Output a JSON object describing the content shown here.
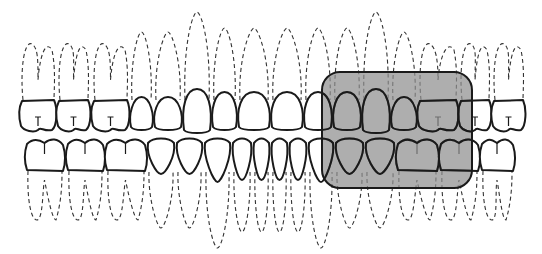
{
  "diagram": {
    "title": "",
    "colors": {
      "background": "#ffffff",
      "outline": "#1a1a1a",
      "root_dash": "#333333",
      "highlight_fill": "#8f8f8f"
    },
    "upper_arch": {
      "label": "",
      "teeth": [
        {
          "type": "molar",
          "x": 20,
          "w": 36
        },
        {
          "type": "molar",
          "x": 57,
          "w": 33
        },
        {
          "type": "molar",
          "x": 92,
          "w": 37
        },
        {
          "type": "premolar",
          "x": 130,
          "w": 23
        },
        {
          "type": "premolar",
          "x": 154,
          "w": 28
        },
        {
          "type": "canine",
          "x": 183,
          "w": 28
        },
        {
          "type": "incisor",
          "x": 212,
          "w": 25
        },
        {
          "type": "incisor",
          "x": 238,
          "w": 32
        },
        {
          "type": "incisor",
          "x": 271,
          "w": 32
        },
        {
          "type": "incisor",
          "x": 304,
          "w": 28
        },
        {
          "type": "incisor",
          "x": 333,
          "w": 28
        },
        {
          "type": "canine",
          "x": 362,
          "w": 28
        },
        {
          "type": "premolar",
          "x": 391,
          "w": 26
        },
        {
          "type": "molar",
          "x": 418,
          "w": 40
        },
        {
          "type": "molar",
          "x": 459,
          "w": 32
        },
        {
          "type": "molar",
          "x": 492,
          "w": 33
        }
      ]
    },
    "lower_arch": {
      "label": "",
      "teeth": [
        {
          "type": "molar",
          "x": 25,
          "w": 39
        },
        {
          "type": "molar",
          "x": 66,
          "w": 38
        },
        {
          "type": "molar",
          "x": 105,
          "w": 41
        },
        {
          "type": "premolar",
          "x": 147,
          "w": 28
        },
        {
          "type": "premolar",
          "x": 176,
          "w": 27
        },
        {
          "type": "canine",
          "x": 204,
          "w": 27
        },
        {
          "type": "incisor",
          "x": 232,
          "w": 20
        },
        {
          "type": "incisor",
          "x": 253,
          "w": 17
        },
        {
          "type": "incisor",
          "x": 271,
          "w": 17
        },
        {
          "type": "incisor",
          "x": 289,
          "w": 18
        },
        {
          "type": "canine",
          "x": 308,
          "w": 26
        },
        {
          "type": "premolar",
          "x": 335,
          "w": 29
        },
        {
          "type": "premolar",
          "x": 365,
          "w": 30
        },
        {
          "type": "molar",
          "x": 396,
          "w": 42
        },
        {
          "type": "molar",
          "x": 439,
          "w": 40
        },
        {
          "type": "molar",
          "x": 480,
          "w": 34
        }
      ]
    },
    "highlight_box": {
      "label": "",
      "x": 322,
      "y": 72,
      "width": 150,
      "height": 116,
      "corner_radius": 18
    }
  }
}
